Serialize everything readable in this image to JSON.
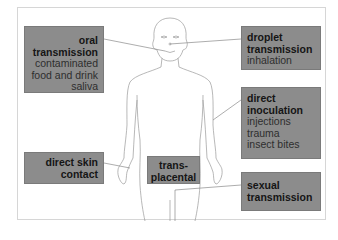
{
  "diagram": {
    "colors": {
      "box_fill": "#8c8c8c",
      "title_text": "#151515",
      "sub_text": "#2e2e2e",
      "line": "#8a8a8a"
    },
    "boxes": {
      "oral": {
        "title_1": "oral",
        "title_2": "transmission",
        "items": [
          "contaminated",
          "food and drink",
          "saliva"
        ]
      },
      "droplet": {
        "title_1": "droplet",
        "title_2": "transmission",
        "items": [
          "inhalation"
        ]
      },
      "inoculation": {
        "title_1": "direct",
        "title_2": "inoculation",
        "items": [
          "injections",
          "trauma",
          "insect bites"
        ]
      },
      "skin": {
        "title_1": "direct skin",
        "title_2": "contact"
      },
      "transplacental": {
        "title_1": "trans-",
        "title_2": "placental"
      },
      "sexual": {
        "title_1": "sexual",
        "title_2": "transmission"
      }
    }
  }
}
